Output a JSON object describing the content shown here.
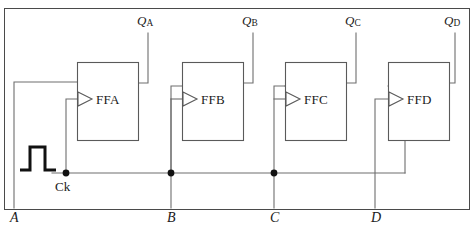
{
  "figure": {
    "kind": "logic-circuit-diagram",
    "border_color": "#4a4a4a",
    "wire_color": "#6e6e6e",
    "box_color": "#5a5a5a",
    "ink_color": "#1a1a1a"
  },
  "flipflops": [
    {
      "name": "FFA",
      "clock_marker": "clock-triangle"
    },
    {
      "name": "FFB",
      "clock_marker": "clock-triangle"
    },
    {
      "name": "FFC",
      "clock_marker": "clock-triangle"
    },
    {
      "name": "FFD",
      "clock_marker": "clock-triangle"
    }
  ],
  "outputs": [
    {
      "base": "Q",
      "sub": "A"
    },
    {
      "base": "Q",
      "sub": "B"
    },
    {
      "base": "Q",
      "sub": "C"
    },
    {
      "base": "Q",
      "sub": "D"
    }
  ],
  "bit_lines": [
    {
      "label": "A"
    },
    {
      "label": "B"
    },
    {
      "label": "C"
    },
    {
      "label": "D"
    }
  ],
  "clock": {
    "label": "Ck",
    "waveform": "single-positive-pulse",
    "junction_count": 3
  }
}
